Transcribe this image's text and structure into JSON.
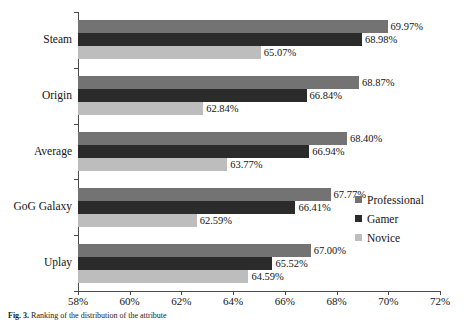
{
  "chart_data": {
    "type": "bar",
    "orientation": "horizontal",
    "title": "",
    "xlabel": "",
    "ylabel": "",
    "xlim": [
      58,
      72
    ],
    "xtick_labels": [
      "58%",
      "60%",
      "62%",
      "64%",
      "66%",
      "68%",
      "70%",
      "72%"
    ],
    "xticks": [
      58,
      60,
      62,
      64,
      66,
      68,
      70,
      72
    ],
    "grid": false,
    "legend_position": "center-right",
    "categories": [
      "Steam",
      "Origin",
      "Average",
      "GoG Galaxy",
      "Uplay"
    ],
    "series": [
      {
        "name": "Professional",
        "color": "#737373",
        "values": [
          69.97,
          68.87,
          68.4,
          67.77,
          67.0
        ],
        "labels": [
          "69.97%",
          "68.87%",
          "68.40%",
          "67.77%",
          "67.00%"
        ]
      },
      {
        "name": "Gamer",
        "color": "#2b2b2b",
        "values": [
          68.98,
          66.84,
          66.94,
          66.41,
          65.52
        ],
        "labels": [
          "68.98%",
          "66.84%",
          "66.94%",
          "66.41%",
          "65.52%"
        ]
      },
      {
        "name": "Novice",
        "color": "#bdbdbd",
        "values": [
          65.07,
          62.84,
          63.77,
          62.59,
          64.59
        ],
        "labels": [
          "65.07%",
          "62.84%",
          "63.77%",
          "62.59%",
          "64.59%"
        ]
      }
    ]
  },
  "legend": {
    "items": [
      {
        "label": "Professional",
        "color": "#737373"
      },
      {
        "label": "Gamer",
        "color": "#2b2b2b"
      },
      {
        "label": "Novice",
        "color": "#bdbdbd"
      }
    ]
  },
  "caption": {
    "prefix": "Fig. 3.",
    "text": "Ranking of the distribution of the attribute"
  }
}
